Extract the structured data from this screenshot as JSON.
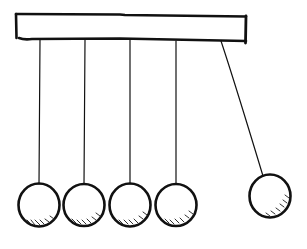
{
  "figure": {
    "subject": "Newton's cradle sketch",
    "style": "hand-drawn ink",
    "colors": {
      "ink": "#111111",
      "background": "#ffffff",
      "hatch": "#333333"
    },
    "bar": {
      "x": 16,
      "y": 14,
      "width": 230,
      "height": 26
    },
    "pendulums": [
      {
        "string_top": [
          40,
          40
        ],
        "string_bottom": [
          39,
          184
        ],
        "ball_center": [
          39,
          205
        ],
        "ball_radius": 21
      },
      {
        "string_top": [
          85,
          40
        ],
        "string_bottom": [
          84,
          184
        ],
        "ball_center": [
          84,
          205
        ],
        "ball_radius": 21
      },
      {
        "string_top": [
          130,
          40
        ],
        "string_bottom": [
          130,
          184
        ],
        "ball_center": [
          130,
          205
        ],
        "ball_radius": 21
      },
      {
        "string_top": [
          176,
          41
        ],
        "string_bottom": [
          176,
          184
        ],
        "ball_center": [
          176,
          205
        ],
        "ball_radius": 21
      },
      {
        "string_top": [
          221,
          41
        ],
        "string_bottom": [
          263,
          176
        ],
        "ball_center": [
          270,
          196
        ],
        "ball_radius": 21,
        "state": "raised"
      }
    ]
  }
}
